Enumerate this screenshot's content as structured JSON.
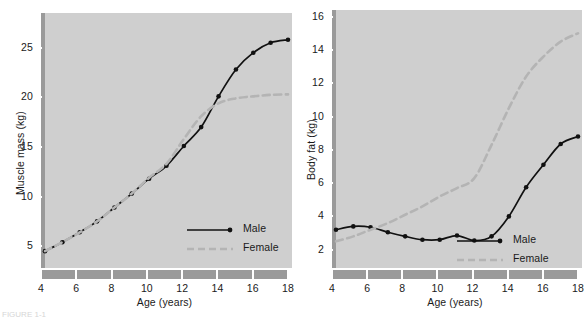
{
  "figure": {
    "caption": "FIGURE 1-1"
  },
  "chart_data": [
    {
      "type": "line",
      "panel": "left",
      "title": "",
      "xlabel": "Age (years)",
      "ylabel": "Muscle mass (kg)",
      "xlim": [
        4,
        18
      ],
      "ylim": [
        2.8,
        28.5
      ],
      "xticks": [
        4,
        6,
        8,
        10,
        12,
        14,
        16,
        18
      ],
      "yticks": [
        5,
        10,
        15,
        20,
        25
      ],
      "grid": false,
      "legend_position": "lower-right",
      "x": [
        4,
        5,
        6,
        7,
        8,
        9,
        10,
        11,
        12,
        13,
        14,
        15,
        16,
        17,
        18
      ],
      "series": [
        {
          "name": "Male",
          "style": "solid",
          "color": "#111111",
          "markers": true,
          "values": [
            4.5,
            5.4,
            6.4,
            7.5,
            8.9,
            10.3,
            11.8,
            13.1,
            15.1,
            17.0,
            20.1,
            22.8,
            24.5,
            25.5,
            25.8
          ]
        },
        {
          "name": "Female",
          "style": "dashed",
          "color": "#b4b4b4",
          "markers": false,
          "values": [
            4.5,
            5.4,
            6.4,
            7.5,
            8.9,
            10.3,
            11.9,
            13.3,
            15.8,
            18.1,
            19.4,
            19.9,
            20.1,
            20.25,
            20.3
          ]
        }
      ]
    },
    {
      "type": "line",
      "panel": "right",
      "title": "",
      "xlabel": "Age (years)",
      "ylabel": "Body fat (kg)",
      "xlim": [
        4,
        18
      ],
      "ylim": [
        0.9,
        16.4
      ],
      "xticks": [
        4,
        6,
        8,
        10,
        12,
        14,
        16,
        18
      ],
      "yticks": [
        2,
        4,
        6,
        8,
        10,
        12,
        14,
        16
      ],
      "grid": false,
      "legend_position": "lower-right",
      "x": [
        4,
        5,
        6,
        7,
        8,
        9,
        10,
        11,
        12,
        13,
        14,
        15,
        16,
        17,
        18
      ],
      "series": [
        {
          "name": "Male",
          "style": "solid",
          "color": "#111111",
          "markers": true,
          "values": [
            3.2,
            3.4,
            3.35,
            3.05,
            2.8,
            2.6,
            2.6,
            2.85,
            2.55,
            2.8,
            4.0,
            5.75,
            7.1,
            8.35,
            8.8
          ]
        },
        {
          "name": "Female",
          "style": "dashed",
          "color": "#b4b4b4",
          "markers": false,
          "values": [
            2.5,
            2.8,
            3.2,
            3.6,
            4.1,
            4.6,
            5.2,
            5.7,
            6.3,
            8.3,
            10.5,
            12.4,
            13.6,
            14.5,
            15.0
          ]
        }
      ]
    }
  ],
  "legend": {
    "male_label": "Male",
    "female_label": "Female"
  },
  "colors": {
    "plot_background": "#cfcfcf",
    "axis_band": "#9a9a9a",
    "male_line": "#111111",
    "female_line": "#b4b4b4",
    "tick_mark": "#ffffff",
    "text": "#1a1a1a"
  }
}
